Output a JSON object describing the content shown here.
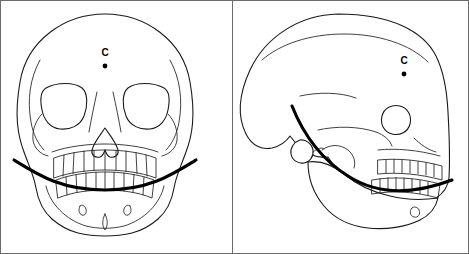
{
  "figure": {
    "title": "",
    "background_color": "#ffffff",
    "width": 469,
    "height": 254,
    "outline_color": "#1a1a1a",
    "curve_color": "#000000",
    "frame_color": "#6b6b6b"
  },
  "panels": [
    {
      "id": "frontal-view",
      "name": "skull-frontal-view",
      "view_label": "",
      "landmark": {
        "label": "C",
        "x": 105,
        "y": 52,
        "dot_x": 105,
        "dot_y": 66
      }
    },
    {
      "id": "lateral-view",
      "name": "skull-lateral-view",
      "view_label": "",
      "landmark": {
        "label": "C",
        "x": 404,
        "y": 60,
        "dot_x": 404,
        "dot_y": 74
      }
    }
  ],
  "annotations": {
    "occlusal_curve_name": "occlusal-plane-curve",
    "landmark_name": "condyle-center-point"
  }
}
